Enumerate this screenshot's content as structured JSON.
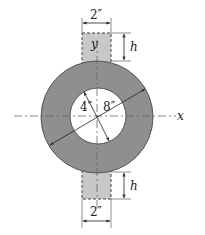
{
  "diagram": {
    "type": "cross-section",
    "colors": {
      "ring_fill": "#8f8f8f",
      "strip_fill": "#c8c8c8",
      "hole_fill": "#ffffff",
      "line": "#333333"
    },
    "labels": {
      "top_width": "2″",
      "top_height": "h",
      "bottom_width": "2″",
      "bottom_height": "h",
      "inner_dim": "4″",
      "outer_dim": "8″",
      "x_axis": "x",
      "y_axis": "y"
    },
    "dimensions": {
      "strip_width_in": 2,
      "strip_height": "h",
      "inner_radius_in": 4,
      "outer_radius_in": 8
    }
  }
}
